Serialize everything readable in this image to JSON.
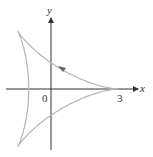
{
  "figure": {
    "curve": "deltoid",
    "x_axis_label": "x",
    "y_axis_label": "y",
    "origin_label": "0",
    "x_tick_label": "3",
    "curve_color": "#b5b5b5",
    "axis_color": "#333333",
    "arrow_color": "#555555"
  }
}
